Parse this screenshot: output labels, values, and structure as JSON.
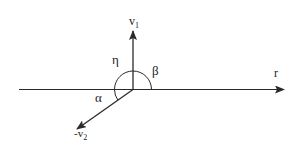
{
  "diagram": {
    "type": "vector-angle-diagram",
    "line_color": "#2a2a2a",
    "background": "#ffffff",
    "vectors": [
      {
        "id": "v1",
        "label": "v",
        "subscript": "1",
        "direction": "up"
      },
      {
        "id": "neg-v2",
        "label": "-v",
        "subscript": "2",
        "direction": "down-left"
      },
      {
        "id": "r",
        "label": "r",
        "subscript": "",
        "direction": "right"
      }
    ],
    "angles": [
      {
        "id": "eta",
        "label": "η",
        "between": [
          "v1",
          "left-axis"
        ]
      },
      {
        "id": "beta",
        "label": "β",
        "between": [
          "r",
          "v1"
        ]
      },
      {
        "id": "alpha",
        "label": "α",
        "between": [
          "left-axis",
          "neg-v2"
        ]
      }
    ]
  }
}
